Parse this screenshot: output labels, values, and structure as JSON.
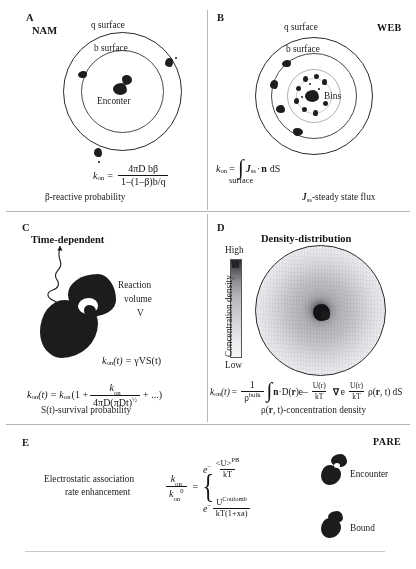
{
  "figure": {
    "panels": [
      {
        "id": "A",
        "label": "A",
        "title": "NAM",
        "corner_tag": "",
        "labels": {
          "outer_surface": "q surface",
          "inner_surface": "b surface",
          "center": "Enconter"
        },
        "equation": {
          "lhs": "k",
          "lhs_sub": "on",
          "eq": "=",
          "numerator": "4πD bβ",
          "denominator": "1–(1–β)b/q"
        },
        "caption": "β-reactive probability"
      },
      {
        "id": "B",
        "label": "B",
        "title": "",
        "corner_tag": "WEB",
        "labels": {
          "outer_surface": "q surface",
          "inner_surface": "b surface",
          "bins": "Bins"
        },
        "equation": {
          "lhs": "k",
          "lhs_sub": "on",
          "eq": "=",
          "integral": "∫",
          "integrand_j": "J",
          "integrand_j_sub": "ss",
          "dot": "·",
          "normal": "n",
          "measure": "dS",
          "under_integral": "surface"
        },
        "caption": "Jₓₓ-steady state flux",
        "caption_symbol": "J",
        "caption_symbol_sub": "ss",
        "caption_rest": "-steady state flux"
      },
      {
        "id": "C",
        "label": "C",
        "title": "Time-dependent",
        "corner_tag": "",
        "labels": {
          "reaction_volume_line1": "Reaction",
          "reaction_volume_line2": "volume",
          "reaction_volume_line3": "V"
        },
        "equation1": {
          "lhs": "k",
          "lhs_sub": "on",
          "arg": "(t)",
          "eq": "=",
          "rhs": "γVS(t)"
        },
        "equation2": {
          "lhs": "k",
          "lhs_sub": "on",
          "arg": "(t)",
          "eq": "=",
          "prefix": "k",
          "prefix_sub": "on",
          "open": "(1 +",
          "numerator": "k",
          "numerator_sub": "on",
          "denominator": "4πD(πDt)",
          "denominator_sup": "½",
          "tail": "+ ...)"
        },
        "caption": "S(t)-survival probability"
      },
      {
        "id": "D",
        "label": "D",
        "title": "Density-distribution",
        "corner_tag": "",
        "labels": {
          "colorbar_high": "High",
          "colorbar_low": "Low",
          "colorbar_axis": "Concentration density"
        },
        "equation": {
          "lhs": "k",
          "lhs_sub": "on",
          "arg": "(t)",
          "eq": "=",
          "frac_num": "1",
          "frac_den": "ρ",
          "frac_den_sup": "bulk",
          "integral": "∫",
          "normal": "n",
          "dot": "·",
          "diff": "D(",
          "diff_r": "r",
          "diff_close": ")",
          "exp1": "e",
          "exp1_num": "U(r)",
          "exp1_den": "kT",
          "exp1_sign": "–",
          "grad": "∇",
          "exp2": "e",
          "exp2_num": "U(r)",
          "exp2_den": "kT",
          "rho": "ρ(",
          "rho_r": "r",
          "rho_t": ", t)",
          "measure": "dS"
        },
        "caption": "ρ(r, t)-concentration density",
        "caption_pre": "ρ(",
        "caption_bold": "r",
        "caption_post": ", t)-concentration density"
      },
      {
        "id": "E",
        "label": "E",
        "title": "",
        "corner_tag": "PARE",
        "labels": {
          "description_line1": "Electrostatic association",
          "description_line2": "rate enhancement",
          "encounter": "Encounter",
          "bound": "Bound"
        },
        "equation": {
          "frac_num": "k",
          "frac_num_sub": "on",
          "frac_den": "k",
          "frac_den_sub": "on",
          "frac_den_sup": "0",
          "eq": "=",
          "brace": "{",
          "case1_e": "e",
          "case1_sign": "–",
          "case1_num": "<U>",
          "case1_num_sup": "PB",
          "case1_den": "kT",
          "case2_e": "e",
          "case2_sign": "–",
          "case2_num": "U",
          "case2_num_sup": "Coulomb",
          "case2_den": "kT(1+xa)"
        },
        "caption": ""
      }
    ]
  },
  "style": {
    "ink": "#1d1d1f",
    "rule": "#b3b3b8",
    "bg": "#ffffff"
  }
}
